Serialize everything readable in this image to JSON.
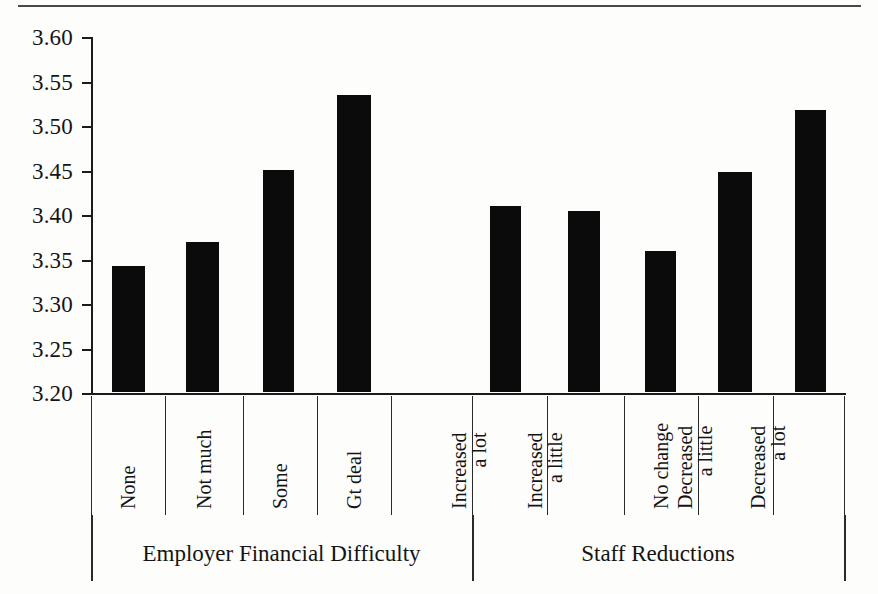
{
  "chart_data": {
    "type": "bar",
    "title": "",
    "subtitle": "",
    "xlabel": "",
    "ylabel": "",
    "ylim": [
      3.2,
      3.6
    ],
    "ytick_step": 0.05,
    "yticks": [
      "3.60",
      "3.55",
      "3.50",
      "3.45",
      "3.40",
      "3.35",
      "3.30",
      "3.25",
      "3.20"
    ],
    "grid": false,
    "legend": "none",
    "bar_color": "#0b0b0b",
    "categories": [
      "None",
      "Not much",
      "Some",
      "Gt deal",
      "Increased a lot",
      "Increased a little",
      "No change",
      "Decreased a little",
      "Decreased a lot"
    ],
    "values": [
      3.342,
      3.368,
      3.45,
      3.534,
      3.409,
      3.403,
      3.359,
      3.447,
      3.517
    ],
    "groups": [
      {
        "label": "Employer Financial Difficulty",
        "categories": [
          "None",
          "Not much",
          "Some",
          "Gt deal"
        ]
      },
      {
        "label": "Staff Reductions",
        "categories": [
          "Increased a lot",
          "Increased a little",
          "No change",
          "Decreased a little",
          "Decreased a lot"
        ]
      }
    ]
  },
  "axis": {
    "y": {
      "ticks": [
        {
          "label": "3.60",
          "value": 3.6
        },
        {
          "label": "3.55",
          "value": 3.55
        },
        {
          "label": "3.50",
          "value": 3.5
        },
        {
          "label": "3.45",
          "value": 3.45
        },
        {
          "label": "3.40",
          "value": 3.4
        },
        {
          "label": "3.35",
          "value": 3.35
        },
        {
          "label": "3.30",
          "value": 3.3
        },
        {
          "label": "3.25",
          "value": 3.25
        },
        {
          "label": "3.20",
          "value": 3.2
        }
      ]
    }
  },
  "categories_display": [
    {
      "line1": "None",
      "line2": ""
    },
    {
      "line1": "Not much",
      "line2": ""
    },
    {
      "line1": "Some",
      "line2": ""
    },
    {
      "line1": "Gt deal",
      "line2": ""
    },
    {
      "line1": "Increased",
      "line2": "a lot"
    },
    {
      "line1": "Increased",
      "line2": "a little"
    },
    {
      "line1": "No change",
      "line2": ""
    },
    {
      "line1": "Decreased",
      "line2": "a little"
    },
    {
      "line1": "Decreased",
      "line2": "a lot"
    }
  ],
  "group_titles": {
    "left": "Employer Financial Difficulty",
    "right": "Staff Reductions"
  }
}
